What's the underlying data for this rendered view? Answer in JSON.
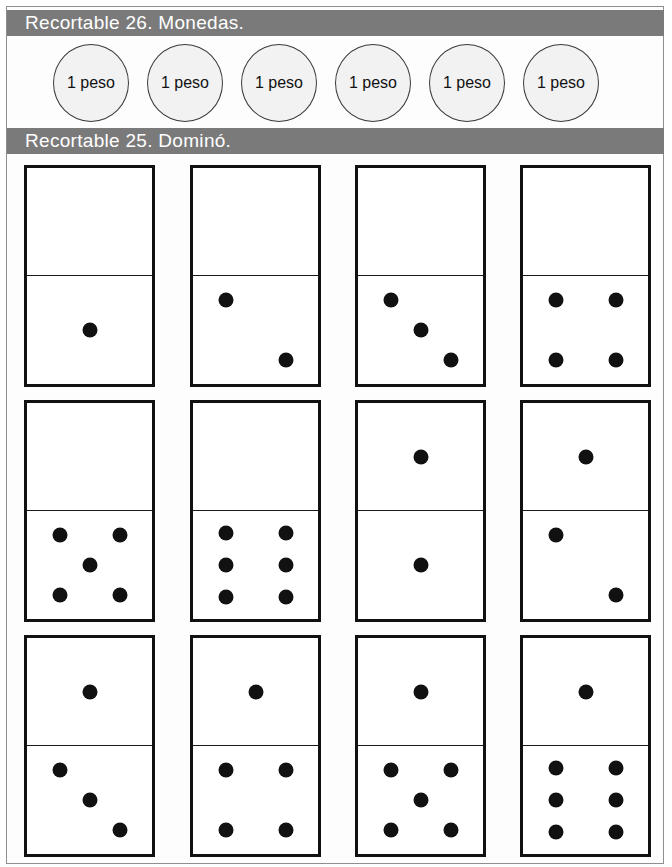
{
  "page": {
    "background_color": "#ffffff",
    "frame_color": "#8f8f8f"
  },
  "sections": {
    "coins": {
      "bar_color": "#7a7a7a",
      "bar_text_color": "#ffffff",
      "title": "Recortable 26. Monedas.",
      "coins": [
        {
          "label": "1 peso"
        },
        {
          "label": "1 peso"
        },
        {
          "label": "1 peso"
        },
        {
          "label": "1 peso"
        },
        {
          "label": "1 peso"
        },
        {
          "label": "1 peso"
        }
      ]
    },
    "domino": {
      "bar_color": "#7a7a7a",
      "bar_text_color": "#ffffff",
      "title": "Recortable 25. Dominó.",
      "pip_color": "#111111",
      "tiles": [
        {
          "top": 0,
          "bottom": 1
        },
        {
          "top": 0,
          "bottom": 2
        },
        {
          "top": 0,
          "bottom": 3
        },
        {
          "top": 0,
          "bottom": 4
        },
        {
          "top": 0,
          "bottom": 5
        },
        {
          "top": 0,
          "bottom": 6
        },
        {
          "top": 1,
          "bottom": 1
        },
        {
          "top": 1,
          "bottom": 2
        },
        {
          "top": 1,
          "bottom": 3
        },
        {
          "top": 1,
          "bottom": 4
        },
        {
          "top": 1,
          "bottom": 5
        },
        {
          "top": 1,
          "bottom": 6
        }
      ]
    }
  },
  "layout": {
    "coin_x": [
      53,
      147,
      241,
      335,
      429,
      523
    ],
    "tile_x": [
      24,
      190,
      355,
      520
    ],
    "tile_y": [
      165,
      400,
      635
    ],
    "tile_w": 131,
    "tile_h": 222
  }
}
